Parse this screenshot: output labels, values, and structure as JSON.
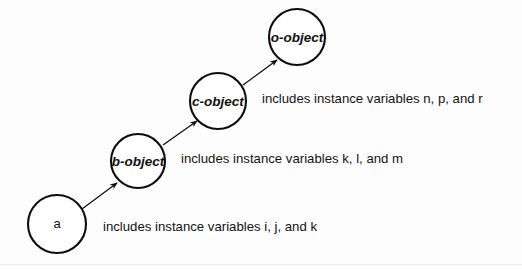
{
  "diagram": {
    "type": "inheritance-chain",
    "title": "",
    "background_color": "#fdfdfd",
    "stroke_color": "#0d0d0d",
    "nodes": [
      {
        "id": "a",
        "label": "a",
        "label_style": "plain",
        "cx": 57,
        "cy": 224,
        "r": 29,
        "annotation": "includes instance variables i, j, and k",
        "annotation_x": 103,
        "annotation_y": 228
      },
      {
        "id": "b-object",
        "label": "b-object",
        "label_style": "italic",
        "cx": 138,
        "cy": 161,
        "r": 27,
        "annotation": "includes instance variables k, l, and m",
        "annotation_x": 181,
        "annotation_y": 160
      },
      {
        "id": "c-object",
        "label": "c-object",
        "label_style": "italic",
        "cx": 218,
        "cy": 101,
        "r": 28,
        "annotation": "includes instance variables n, p, and r",
        "annotation_x": 262,
        "annotation_y": 100
      },
      {
        "id": "o-object",
        "label": "o-object",
        "label_style": "italic",
        "cx": 297,
        "cy": 37,
        "r": 28,
        "annotation": "",
        "annotation_x": 0,
        "annotation_y": 0
      }
    ],
    "edges": [
      {
        "from": "a",
        "to": "b-object",
        "x1": 82,
        "y1": 209,
        "x2": 117,
        "y2": 183,
        "arrowhead": true
      },
      {
        "from": "b-object",
        "to": "c-object",
        "x1": 163,
        "y1": 145,
        "x2": 197,
        "y2": 121,
        "arrowhead": true
      },
      {
        "from": "c-object",
        "to": "o-object",
        "x1": 243,
        "y1": 85,
        "x2": 277,
        "y2": 60,
        "arrowhead": true
      }
    ]
  }
}
